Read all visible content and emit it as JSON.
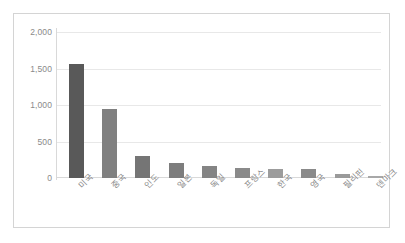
{
  "chart_data": {
    "type": "bar",
    "title": "",
    "subtitle": "",
    "xlabel": "",
    "ylabel": "",
    "categories": [
      "미국",
      "중국",
      "인도",
      "일본",
      "독일",
      "프랑스",
      "한국",
      "영국",
      "필리핀",
      "덴마크"
    ],
    "values": [
      1560,
      940,
      295,
      205,
      170,
      135,
      130,
      125,
      50,
      25
    ],
    "series": [
      {
        "name": "",
        "values": [
          1560,
          940,
          295,
          205,
          170,
          135,
          130,
          125,
          50,
          25
        ]
      }
    ],
    "bar_colors": [
      "#595959",
      "#808080",
      "#757575",
      "#7d7d7d",
      "#848484",
      "#8a8a8a",
      "#9c9c9c",
      "#8a8a8a",
      "#9a9a9a",
      "#a8a8a8"
    ],
    "ylim": [
      0,
      2000
    ],
    "y_ticks": [
      0,
      500,
      1000,
      1500,
      2000
    ],
    "y_tick_labels": [
      "0",
      "500",
      "1,000",
      "1,500",
      "2,000"
    ],
    "grid": true,
    "grid_axis": "y",
    "legend": false,
    "legend_position": "none",
    "plot_background": "#ffffff",
    "grid_color": "#e8e8e8",
    "axis_color": "#d9d9d9",
    "tick_label_color": "#8a8a8a",
    "frame_border_color": "#d4d4d4"
  }
}
